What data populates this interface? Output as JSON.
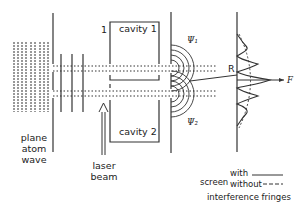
{
  "figure": {
    "labels": {
      "plane_atom_wave": [
        "plane",
        "atom",
        "wave"
      ],
      "laser_beam": [
        "laser",
        "beam"
      ],
      "cavity_1": "cavity 1",
      "cavity_2": "cavity 2",
      "slit_label": "1",
      "psi_1": "Ψ₁",
      "psi_2": "Ψ₂",
      "point_R": "R",
      "point_F": "F"
    },
    "legend": {
      "screen": "screen",
      "with": "with",
      "without": "without",
      "caption": "interference fringes"
    }
  }
}
